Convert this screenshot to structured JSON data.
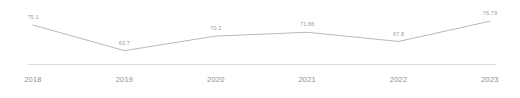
{
  "chart_data": {
    "type": "line",
    "title": "",
    "subtitle": "",
    "xlabel": "",
    "ylabel": "",
    "categories": [
      "2018",
      "2019",
      "2020",
      "2021",
      "2022",
      "2023"
    ],
    "values": [
      75.1,
      63.7,
      70.2,
      71.86,
      67.8,
      76.79
    ],
    "value_labels": [
      "75.1",
      "63.7",
      "70.2",
      "71.86",
      "67.8",
      "76.79"
    ],
    "series": [
      {
        "name": "",
        "values": [
          75.1,
          63.7,
          70.2,
          71.86,
          67.8,
          76.79
        ]
      }
    ],
    "ylim": [
      60,
      80
    ],
    "grid": false,
    "legend": false,
    "legend_position": "none",
    "annotations": [],
    "line_color": "#b0b0b0",
    "label_color": "#9b9b9b",
    "tick_color": "#8e8e8e",
    "axis_color": "#dcdcdc",
    "background_color": "#ffffff"
  },
  "axis": {
    "x_ticks": [
      "2018",
      "2019",
      "2020",
      "2021",
      "2022",
      "2023"
    ]
  }
}
